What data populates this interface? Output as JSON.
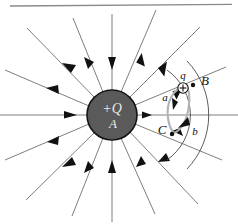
{
  "figure": {
    "background_color": "#ffffff",
    "width": 238,
    "height": 224
  },
  "top_rule": {
    "name": "page-border-line",
    "color": "#8a8a8a"
  },
  "sphere": {
    "name": "charged-sphere",
    "fill_color": "#5a5a5a",
    "stroke_color": "#151515",
    "center_x": 112,
    "center_y": 115,
    "radius": 25,
    "charge_label": "+Q",
    "body_label": "A",
    "label_color": "#e8e8e8"
  },
  "field_lines": {
    "name": "electric-field-lines",
    "color": "#6f6f6f",
    "arrow_color": "#111111",
    "count": 16,
    "arrow_direction": "inward",
    "angles_deg": [
      0,
      22,
      45,
      68,
      90,
      112,
      135,
      158,
      180,
      202,
      225,
      248,
      270,
      292,
      315,
      338
    ]
  },
  "equipotentials": {
    "name": "equipotential-arcs",
    "color": "#4a4a4a",
    "arcs": [
      {
        "label": "inner-arc",
        "radius": 55
      },
      {
        "label": "outer-arc",
        "radius": 78
      }
    ]
  },
  "path_loop": {
    "name": "closed-path-loop",
    "color": "#b0b0b0",
    "segment_a_label": "a",
    "segment_b_label": "b",
    "arrow_color": "#111111"
  },
  "points": [
    {
      "name": "point-b",
      "label": "B",
      "x": 199,
      "y": 82,
      "dot_x": 190,
      "dot_y": 85
    },
    {
      "name": "point-c",
      "label": "C",
      "x": 161,
      "y": 133,
      "dot_x": 172,
      "dot_y": 132
    }
  ],
  "test_charge": {
    "name": "test-charge",
    "label": "q",
    "symbol": "+",
    "center_x": 183,
    "center_y": 88,
    "radius": 5
  }
}
